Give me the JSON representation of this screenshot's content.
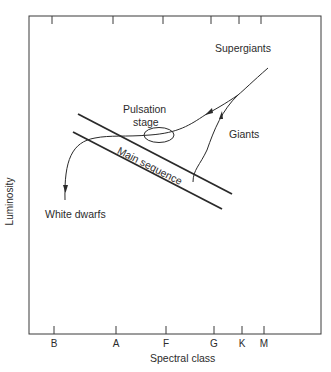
{
  "diagram": {
    "type": "Hertzsprung-Russell evolutionary diagram",
    "x_axis": {
      "label": "Spectral class",
      "ticks": [
        {
          "label": "B",
          "x": 54
        },
        {
          "label": "A",
          "x": 116
        },
        {
          "label": "F",
          "x": 166
        },
        {
          "label": "G",
          "x": 214
        },
        {
          "label": "K",
          "x": 242
        },
        {
          "label": "M",
          "x": 264
        }
      ]
    },
    "y_axis": {
      "label": "Luminosity"
    },
    "regions": {
      "supergiants": "Supergiants",
      "pulsation": "Pulsation",
      "stage": "stage",
      "giants": "Giants",
      "main_sequence": "Main sequence",
      "white_dwarfs": "White dwarfs"
    },
    "colors": {
      "line": "#2a2a2a",
      "background": "#ffffff"
    }
  }
}
